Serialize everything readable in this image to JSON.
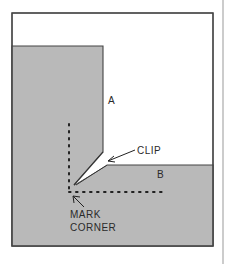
{
  "diagram": {
    "labels": {
      "panel_a": "A",
      "panel_b": "B",
      "clip": "CLIP",
      "mark_line1": "MARK",
      "mark_line2": "CORNER"
    },
    "colors": {
      "panel_fill": "#b9b9b9",
      "outline": "#444444",
      "background": "#ffffff",
      "text": "#2a2a2a"
    }
  }
}
